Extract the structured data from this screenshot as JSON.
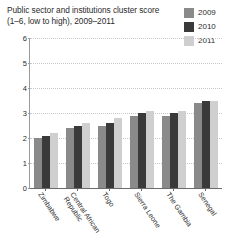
{
  "title": {
    "line1": "Public sector and institutions cluster score",
    "line2": "(1–6, low to high), 2009–2011"
  },
  "legend": {
    "position": "top-right",
    "items": [
      {
        "label": "2009",
        "color": "#8a8a8a"
      },
      {
        "label": "2010",
        "color": "#3a3a3a"
      },
      {
        "label": "2011",
        "color": "#cfcfcf"
      }
    ]
  },
  "axis": {
    "y_ticks": [
      "0",
      "1",
      "2",
      "3",
      "4",
      "5",
      "6"
    ],
    "y_min": 0,
    "y_max": 6
  },
  "chart_data": {
    "type": "bar",
    "title": "Public sector and institutions cluster score (1–6, low to high), 2009–2011",
    "xlabel": "",
    "ylabel": "",
    "ylim": [
      0,
      6
    ],
    "yticks": [
      0,
      1,
      2,
      3,
      4,
      5,
      6
    ],
    "grid": true,
    "legend_position": "top-right",
    "categories": [
      "Zimbabwe",
      "Central African Republic",
      "Togo",
      "Sierra Leone",
      "The Gambia",
      "Senegal"
    ],
    "category_lines": [
      [
        "Zimbabwe"
      ],
      [
        "Central African",
        "Republic"
      ],
      [
        "Togo"
      ],
      [
        "Sierra Leone"
      ],
      [
        "The Gambia"
      ],
      [
        "Senegal"
      ]
    ],
    "series": [
      {
        "name": "2009",
        "color": "#8a8a8a",
        "values": [
          2.0,
          2.4,
          2.5,
          2.9,
          2.9,
          3.4
        ]
      },
      {
        "name": "2010",
        "color": "#3a3a3a",
        "values": [
          2.1,
          2.5,
          2.6,
          3.0,
          3.0,
          3.5
        ]
      },
      {
        "name": "2011",
        "color": "#cfcfcf",
        "values": [
          2.2,
          2.6,
          2.8,
          3.1,
          3.1,
          3.5
        ]
      }
    ]
  }
}
